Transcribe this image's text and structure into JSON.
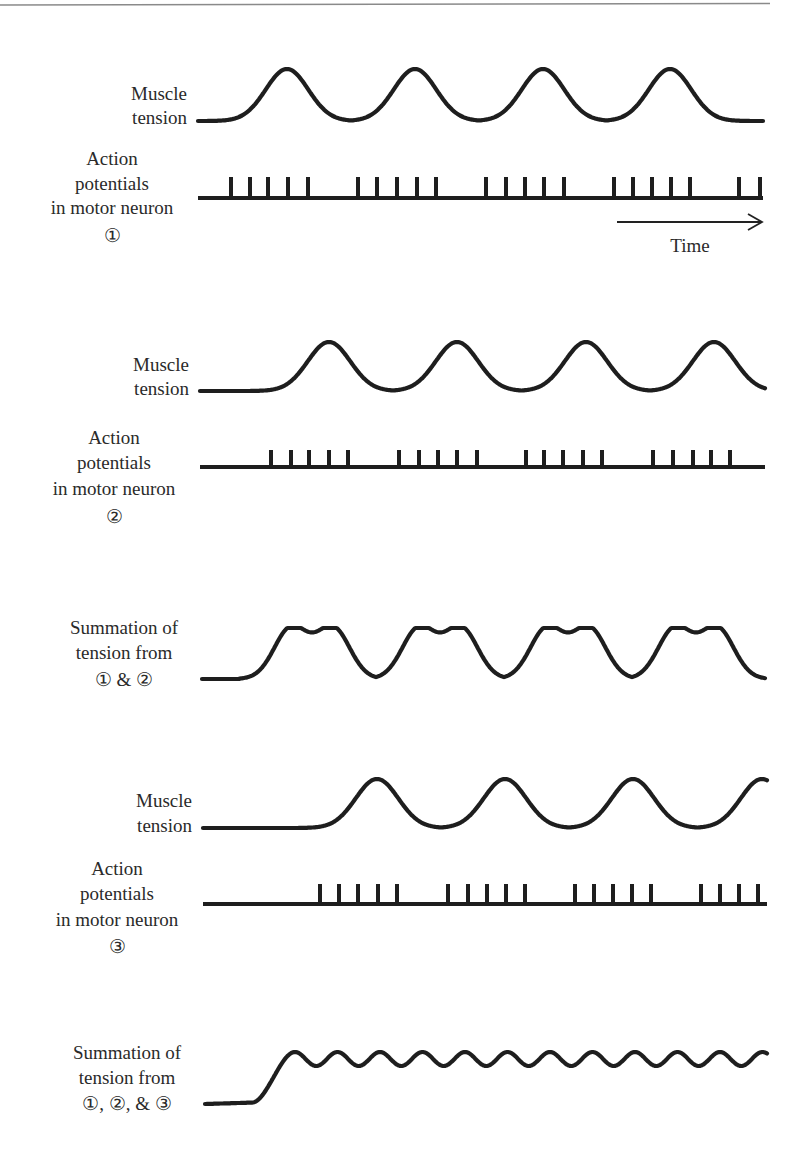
{
  "figure": {
    "rule_color": "#8a8a8a",
    "ink_color": "#1e1e1e",
    "time_axis": {
      "label": "Time",
      "x1": 617,
      "x2": 762,
      "y": 222,
      "label_x": 690,
      "label_y": 252
    }
  },
  "panels": [
    {
      "id": "neuron1",
      "tension_label": [
        "Muscle",
        "tension"
      ],
      "tension": {
        "x_start": 198,
        "x_end": 763,
        "baseline_y": 121,
        "peak_y": 69,
        "peaks_x": [
          287,
          415,
          543,
          670
        ],
        "half_width": 38,
        "end_y": 109
      },
      "ap_label": [
        "Action",
        "potentials",
        "in motor neuron",
        "①"
      ],
      "spikes": {
        "x_start": 198,
        "x_end": 763,
        "baseline_y": 198,
        "top_y": 177,
        "x": [
          231,
          250,
          268,
          288,
          308,
          358,
          377,
          397,
          417,
          436,
          486,
          506,
          525,
          544,
          564,
          614,
          633,
          652,
          671,
          690,
          739,
          760
        ]
      }
    },
    {
      "id": "neuron2",
      "tension_label": [
        "Muscle",
        "tension"
      ],
      "tension": {
        "x_start": 200,
        "x_end": 765,
        "baseline_y": 391,
        "peak_y": 342,
        "peaks_x": [
          329,
          457,
          586,
          714
        ],
        "half_width": 38,
        "end_y": 389
      },
      "ap_label": [
        "Action",
        "potentials",
        "in motor neuron",
        "②"
      ],
      "spikes": {
        "x_start": 200,
        "x_end": 765,
        "baseline_y": 467,
        "top_y": 450,
        "x": [
          271,
          291,
          309,
          329,
          348,
          399,
          419,
          438,
          457,
          477,
          526,
          544,
          563,
          583,
          602,
          653,
          673,
          693,
          711,
          730
        ]
      }
    },
    {
      "id": "neuron3",
      "tension_label": [
        "Muscle",
        "tension"
      ],
      "tension": {
        "x_start": 203,
        "x_end": 767,
        "baseline_y": 828,
        "peak_y": 779,
        "peaks_x": [
          377,
          505,
          633,
          762
        ],
        "half_width": 38,
        "end_y": 785
      },
      "ap_label": [
        "Action",
        "potentials",
        "in motor neuron",
        "③"
      ],
      "spikes": {
        "x_start": 203,
        "x_end": 767,
        "baseline_y": 904,
        "top_y": 884,
        "x": [
          320,
          339,
          358,
          378,
          397,
          448,
          468,
          487,
          506,
          525,
          575,
          594,
          613,
          632,
          651,
          701,
          720,
          739,
          758
        ]
      }
    }
  ],
  "summations": [
    {
      "id": "sum12",
      "label": [
        "Summation of",
        "tension from",
        "① & ②"
      ],
      "curve": {
        "x_start": 202,
        "x_end": 765,
        "baseline_y": 679,
        "rise_start_x": 240,
        "peak_y": 628,
        "dip_y": 642,
        "valley_y": 677,
        "double_peaks": [
          [
            291,
            333
          ],
          [
            419,
            461
          ],
          [
            547,
            589
          ],
          [
            675,
            717
          ]
        ],
        "valleys_x": [
          377,
          505,
          633,
          761
        ]
      }
    },
    {
      "id": "sum123",
      "label": [
        "Summation of",
        "tension from",
        "①, ②, & ③"
      ],
      "curve": {
        "x_start": 205,
        "x_end": 767,
        "baseline_y": 1104,
        "rise_start_x": 252,
        "peak_y": 1052,
        "trough_y": 1066,
        "first_peak_x": 295,
        "period": 42.5
      }
    }
  ],
  "chart_data": {
    "type": "line",
    "title": "",
    "xlabel": "Time",
    "ylabel": "Muscle tension",
    "series": [
      {
        "name": "Muscle tension (motor neuron 1)",
        "peaks_at_relative_time": [
          0.16,
          0.38,
          0.61,
          0.84
        ],
        "spike_bursts": 4,
        "spikes_per_burst": 5
      },
      {
        "name": "Muscle tension (motor neuron 2)",
        "peaks_at_relative_time": [
          0.23,
          0.46,
          0.68,
          0.91
        ],
        "spike_bursts": 4,
        "spikes_per_burst": 5
      },
      {
        "name": "Summation of tension from 1 & 2",
        "pattern": "double-humped peaks with deep valleys"
      },
      {
        "name": "Muscle tension (motor neuron 3)",
        "peaks_at_relative_time": [
          0.31,
          0.53,
          0.76,
          0.99
        ],
        "spike_bursts": 4,
        "spikes_per_burst": 5
      },
      {
        "name": "Summation of tension from 1, 2, & 3",
        "pattern": "smooth plateau with small ripples (~13 ripples)"
      }
    ]
  }
}
